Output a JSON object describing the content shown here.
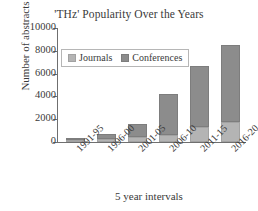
{
  "chart_data": {
    "type": "bar",
    "subtype": "stacked-bar",
    "title": "'THz' Popularity Over the Years",
    "xlabel": "5 year intervals",
    "ylabel": "Number of abstracts",
    "categories": [
      "1991-95",
      "1996-00",
      "2001-05",
      "2006-10",
      "2011-15",
      "2016-20"
    ],
    "series": [
      {
        "name": "Journals",
        "color": "#b4b4b4",
        "values": [
          180,
          300,
          400,
          600,
          1350,
          1750
        ]
      },
      {
        "name": "Conferences",
        "color": "#8c8c8c",
        "values": [
          70,
          400,
          1200,
          3650,
          5350,
          6750
        ]
      }
    ],
    "totals": [
      250,
      700,
      1600,
      4250,
      6700,
      8500
    ],
    "ylim": [
      0,
      10000
    ],
    "yticks": [
      0,
      2000,
      4000,
      6000,
      8000,
      10000
    ],
    "ytick_labels": [
      "0",
      "2000",
      "4000",
      "6000",
      "8000",
      "10000"
    ],
    "grid": false,
    "legend_position": "upper-left-inside",
    "xtick_rotation": -45
  }
}
